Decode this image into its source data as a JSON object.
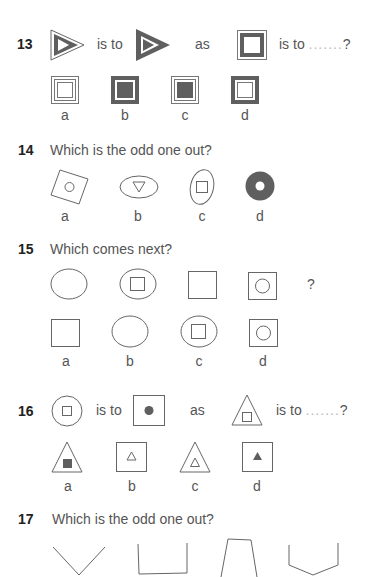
{
  "questions": [
    {
      "number": "13",
      "type": "analogy",
      "words": {
        "is_to_1": "is to",
        "as": "as",
        "is_to_2": "is to",
        "dots": ".......",
        "qmark": "?"
      },
      "shapes": [
        "triangle-outline-with-filled-border",
        "triangle-filled-border-inverse",
        "square-double-frame-dark-inner"
      ],
      "options": [
        {
          "label": "a",
          "shape": "square-double-frame-white"
        },
        {
          "label": "b",
          "shape": "square-dark-frame-dark-center"
        },
        {
          "label": "c",
          "shape": "square-light-frame-dark-center"
        },
        {
          "label": "d",
          "shape": "square-dark-frame-white-center"
        }
      ]
    },
    {
      "number": "14",
      "prompt": "Which is the odd one out?",
      "options": [
        {
          "label": "a",
          "shape": "tilted-square-with-circle"
        },
        {
          "label": "b",
          "shape": "ellipse-with-triangle"
        },
        {
          "label": "c",
          "shape": "ellipse-with-square"
        },
        {
          "label": "d",
          "shape": "filled-circle-with-hole"
        }
      ]
    },
    {
      "number": "15",
      "prompt": "Which comes next?",
      "sequence": [
        "ellipse",
        "ellipse-with-square",
        "square",
        "square-with-circle"
      ],
      "sequence_end": "?",
      "options": [
        {
          "label": "a",
          "shape": "square"
        },
        {
          "label": "b",
          "shape": "ellipse"
        },
        {
          "label": "c",
          "shape": "ellipse-with-square"
        },
        {
          "label": "d",
          "shape": "square-with-circle"
        }
      ]
    },
    {
      "number": "16",
      "type": "analogy",
      "words": {
        "is_to_1": "is to",
        "as": "as",
        "is_to_2": "is to",
        "dots": ".......",
        "qmark": "?"
      },
      "shapes": [
        "circle-with-square",
        "square-with-filled-circle",
        "triangle-with-square"
      ],
      "options": [
        {
          "label": "a",
          "shape": "triangle-with-filled-square"
        },
        {
          "label": "b",
          "shape": "square-with-triangle"
        },
        {
          "label": "c",
          "shape": "triangle-with-triangle"
        },
        {
          "label": "d",
          "shape": "square-with-filled-triangle"
        }
      ]
    },
    {
      "number": "17",
      "prompt": "Which is the odd one out?",
      "options": [
        {
          "label": "a",
          "shape": "v-shape"
        },
        {
          "label": "b",
          "shape": "open-square-u"
        },
        {
          "label": "c",
          "shape": "open-trapezoid"
        },
        {
          "label": "d",
          "shape": "open-hexagon-bottom"
        }
      ]
    }
  ],
  "colors": {
    "stroke": "#666666",
    "fill_dark": "#5f5f5f",
    "text": "#555555",
    "number": "#222222"
  }
}
